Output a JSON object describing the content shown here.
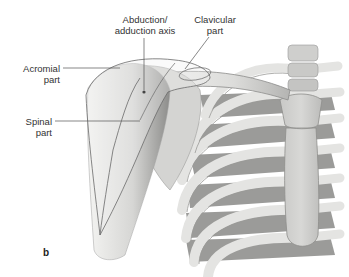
{
  "figure": {
    "panel_letter": "b",
    "labels": {
      "abduction_axis": {
        "line1": "Abduction/",
        "line2": "adduction axis"
      },
      "clavicular_part": {
        "line1": "Clavicular",
        "line2": "part"
      },
      "acromial_part": {
        "line1": "Acromial",
        "line2": "part"
      },
      "spinal_part": {
        "line1": "Spinal",
        "line2": "part"
      }
    },
    "colors": {
      "bone": "#e6e6e4",
      "bone_shadow": "#a8a8a6",
      "muscle_outline": "#6a6a6a",
      "rib_dark": "#7a7a78",
      "leader_line": "#555555"
    }
  }
}
